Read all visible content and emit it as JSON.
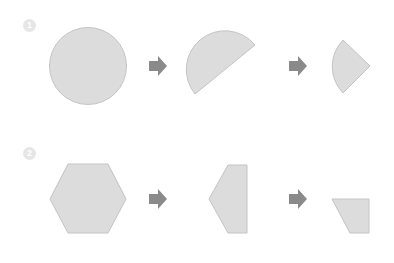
{
  "diagram": {
    "rows": [
      {
        "step_label": "1",
        "shapes": [
          "circle",
          "semicircle",
          "quarter-circle"
        ],
        "arrows": [
          "arrow-right",
          "arrow-right"
        ]
      },
      {
        "step_label": "2",
        "shapes": [
          "hexagon",
          "half-hexagon",
          "trapezoid"
        ],
        "arrows": [
          "arrow-right",
          "arrow-right"
        ]
      }
    ],
    "colors": {
      "shape_fill": "#dcdcdc",
      "shape_stroke": "#c4c4c4",
      "arrow": "#8a8a8a",
      "badge": "#e6e6e6"
    }
  }
}
